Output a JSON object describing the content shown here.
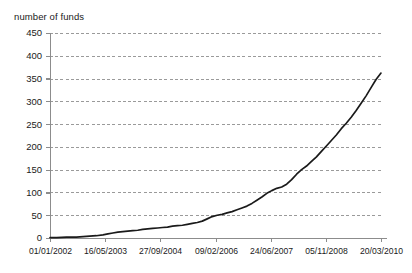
{
  "chart_data": {
    "type": "line",
    "title": "number of funds",
    "xlabel": "",
    "ylabel": "",
    "ylim": [
      0,
      450
    ],
    "ytick_values": [
      0,
      50,
      100,
      150,
      200,
      250,
      300,
      350,
      400,
      450
    ],
    "ytick_labels": [
      "0",
      "50",
      "100",
      "150",
      "200",
      "250",
      "300",
      "350",
      "400",
      "450"
    ],
    "xtick_labels": [
      "01/01/2002",
      "16/05/2003",
      "27/09/2004",
      "09/02/2006",
      "24/06/2007",
      "05/11/2008",
      "20/03/2010"
    ],
    "grid": true,
    "grid_style": "dashed",
    "legend": "none",
    "series": [
      {
        "name": "number of funds",
        "color": "#1a1a1a",
        "x": [
          0.0,
          0.02,
          0.05,
          0.08,
          0.1,
          0.12,
          0.14,
          0.16,
          0.175,
          0.19,
          0.205,
          0.22,
          0.235,
          0.25,
          0.265,
          0.28,
          0.295,
          0.31,
          0.325,
          0.34,
          0.355,
          0.37,
          0.385,
          0.4,
          0.415,
          0.43,
          0.445,
          0.46,
          0.475,
          0.49,
          0.505,
          0.52,
          0.535,
          0.55,
          0.565,
          0.58,
          0.595,
          0.61,
          0.625,
          0.64,
          0.655,
          0.67,
          0.685,
          0.7,
          0.715,
          0.73,
          0.745,
          0.76,
          0.775,
          0.79,
          0.805,
          0.82,
          0.835,
          0.85,
          0.865,
          0.88,
          0.895,
          0.91,
          0.925,
          0.94,
          0.955,
          0.97,
          0.985,
          1.0
        ],
        "y": [
          1,
          1,
          2,
          2,
          3,
          4,
          5,
          7,
          9,
          11,
          13,
          14,
          15,
          16,
          17,
          19,
          20,
          21,
          22,
          23,
          24,
          26,
          27,
          28,
          30,
          32,
          34,
          37,
          42,
          47,
          50,
          52,
          55,
          58,
          62,
          66,
          70,
          76,
          83,
          90,
          98,
          104,
          109,
          112,
          118,
          128,
          140,
          150,
          158,
          168,
          178,
          190,
          202,
          214,
          226,
          240,
          252,
          265,
          280,
          296,
          312,
          330,
          348,
          362
        ]
      }
    ],
    "colors": {
      "line": "#1a1a1a",
      "grid": "#9a9a9a",
      "axis": "#8c8c8c",
      "text": "#1a1a1a",
      "background": "#ffffff"
    }
  }
}
